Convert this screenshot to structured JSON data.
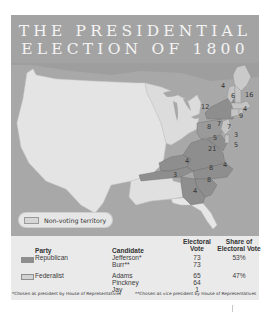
{
  "title": {
    "line1": "THE PRESIDENTIAL",
    "line2": "ELECTION OF 1800"
  },
  "colors": {
    "title_band": "#a3a3a3",
    "ocean": "#a8a8a8",
    "non_voting": "#e3e3e3",
    "territory_unorganized": "#d9d9d9",
    "republican": "#8e8e8e",
    "federalist": "#c9c9c9",
    "table_bg": "#eaeaea"
  },
  "map": {
    "state_votes": [
      {
        "label": "4",
        "state": "Vermont"
      },
      {
        "label": "6",
        "state": "New Hampshire"
      },
      {
        "label": "16",
        "state": "Massachusetts"
      },
      {
        "label": "12",
        "state": "New York"
      },
      {
        "label": "4",
        "state": "Rhode Island"
      },
      {
        "label": "9",
        "state": "Connecticut"
      },
      {
        "label": "8",
        "state": "Pennsylvania (west)"
      },
      {
        "label": "7",
        "state": "Pennsylvania (east)"
      },
      {
        "label": "7",
        "state": "New Jersey"
      },
      {
        "label": "3",
        "state": "Delaware"
      },
      {
        "label": "5",
        "state": "Maryland (west)"
      },
      {
        "label": "5",
        "state": "Maryland (east)"
      },
      {
        "label": "21",
        "state": "Virginia"
      },
      {
        "label": "4",
        "state": "Kentucky"
      },
      {
        "label": "3",
        "state": "Tennessee"
      },
      {
        "label": "8",
        "state": "North Carolina (Republican)"
      },
      {
        "label": "4",
        "state": "North Carolina (Federalist)"
      },
      {
        "label": "8",
        "state": "South Carolina"
      },
      {
        "label": "4",
        "state": "Georgia"
      }
    ]
  },
  "legend": {
    "non_voting_label": "Non-voting territory"
  },
  "table": {
    "headers": {
      "party": "Party",
      "candidate": "Candidate",
      "electoral_vote_line1": "Electoral",
      "electoral_vote_line2": "Vote",
      "share_line1": "Share of",
      "share_line2": "Electoral Vote"
    },
    "rows": [
      {
        "party": "Republican",
        "candidates": [
          {
            "name": "Jefferson*",
            "votes": "73"
          },
          {
            "name": "Burr**",
            "votes": "73"
          }
        ],
        "share": "53%"
      },
      {
        "party": "Federalist",
        "candidates": [
          {
            "name": "Adams",
            "votes": "65"
          },
          {
            "name": "Pinckney",
            "votes": "64"
          },
          {
            "name": "Jay",
            "votes": "1"
          }
        ],
        "share": "47%"
      }
    ],
    "footnote1": "*Chosen as president by House of Representatives",
    "footnote2": "**Chosen as vice president by House of Representatives"
  }
}
